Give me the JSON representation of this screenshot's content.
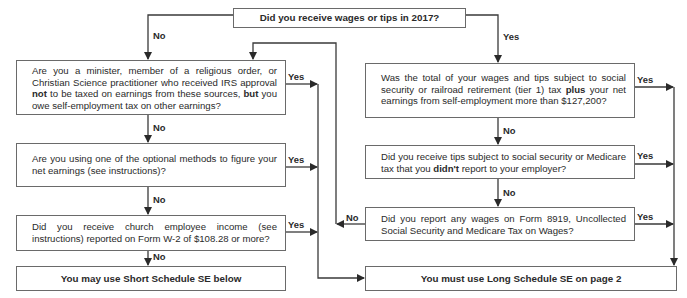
{
  "start": {
    "question": "Did you receive wages or tips in 2017?"
  },
  "left_branch": {
    "entry_label": "No",
    "q1": {
      "pre": "Are you a minister, member of a religious order, or Christian Science practitioner who received IRS approval ",
      "b1": "not",
      "mid": " to be taxed on earnings from these sources, ",
      "b2": "but",
      "post": " you owe self-employment tax on other earnings?",
      "yes": "Yes",
      "no": "No"
    },
    "q2": {
      "text": "Are you using one of the optional methods to figure your net earnings (see instructions)?",
      "yes": "Yes",
      "no": "No"
    },
    "q3": {
      "text": "Did you receive church employee income (see instructions) reported on Form  W-2 of $108.28 or more?",
      "yes": "Yes",
      "no": "No"
    },
    "result": "You may use Short Schedule SE below"
  },
  "right_branch": {
    "entry_label": "Yes",
    "q1": {
      "pre": "Was the total of your wages and tips subject to social security or railroad retirement (tier 1) tax ",
      "b1": "plus",
      "post": " your net earnings from self-employment more than $127,200?",
      "yes": "Yes",
      "no": "No"
    },
    "q2": {
      "pre": "Did you receive tips subject to social security or Medicare tax that you ",
      "b1": "didn't",
      "post": " report to your employer?",
      "yes": "Yes",
      "no": "No"
    },
    "q3": {
      "text": "Did you report any wages on Form 8919, Uncollected Social Security and Medicare Tax on Wages?",
      "yes": "Yes",
      "no": "No"
    },
    "result": "You must use Long Schedule SE on page 2"
  }
}
